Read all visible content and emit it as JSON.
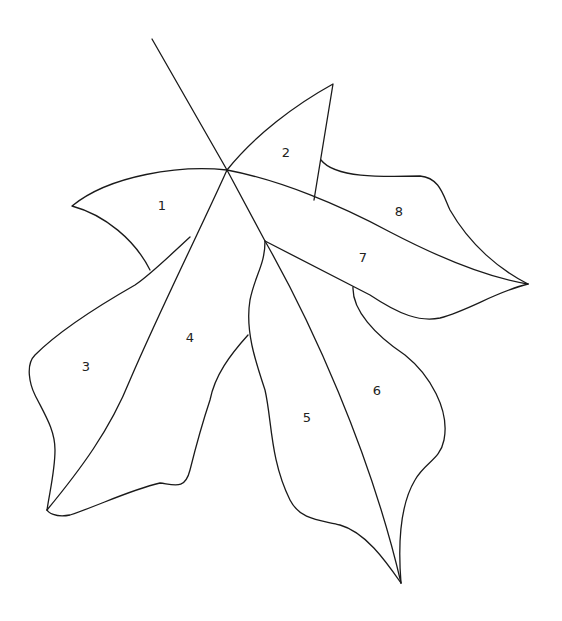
{
  "diagram": {
    "background": "#ffffff",
    "stroke_color": "#1a1a1a",
    "sections": [
      {
        "id": 1,
        "label": "1",
        "x": 162,
        "y": 206
      },
      {
        "id": 2,
        "label": "2",
        "x": 286,
        "y": 153
      },
      {
        "id": 3,
        "label": "3",
        "x": 86,
        "y": 367
      },
      {
        "id": 4,
        "label": "4",
        "x": 190,
        "y": 338
      },
      {
        "id": 5,
        "label": "5",
        "x": 307,
        "y": 418
      },
      {
        "id": 6,
        "label": "6",
        "x": 377,
        "y": 391
      },
      {
        "id": 7,
        "label": "7",
        "x": 363,
        "y": 258
      },
      {
        "id": 8,
        "label": "8",
        "x": 399,
        "y": 212
      }
    ]
  }
}
